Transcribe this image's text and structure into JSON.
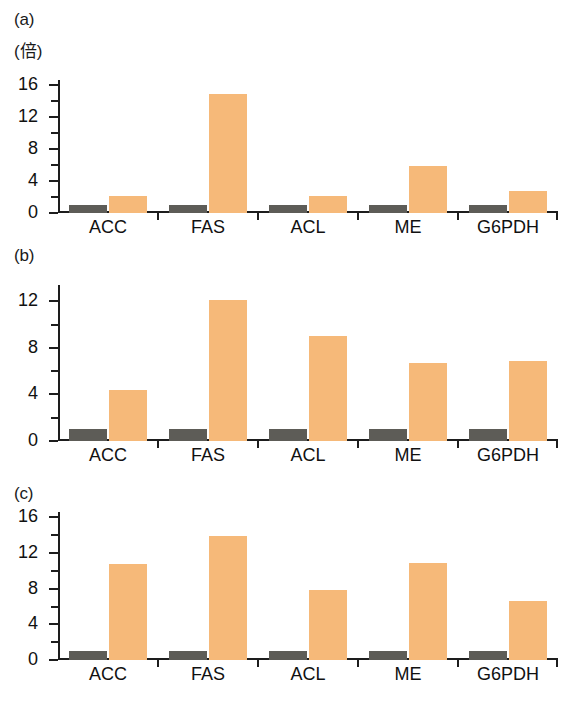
{
  "figure": {
    "unit_label": "(倍)",
    "categories": [
      "ACC",
      "FAS",
      "ACL",
      "ME",
      "G6PDH"
    ],
    "series_names": [
      "control",
      "treatment"
    ],
    "colors": {
      "control": "#5d5c57",
      "treatment": "#f6b979",
      "axis": "#1d1d1d",
      "background": "#ffffff"
    }
  },
  "panels": [
    {
      "label": "(a)",
      "unit_label": "(倍)",
      "ylim": [
        0,
        16.6
      ],
      "yticks_major": [
        0,
        4,
        8,
        12,
        16
      ],
      "yticks_minor": [
        2,
        6,
        10,
        14
      ],
      "ytick_labels": [
        "0",
        "4",
        "8",
        "12",
        "16"
      ]
    },
    {
      "label": "(b)",
      "ylim": [
        0,
        13.4
      ],
      "yticks_major": [
        0,
        4,
        8,
        12
      ],
      "yticks_minor": [
        2,
        6,
        10
      ],
      "ytick_labels": [
        "0",
        "4",
        "8",
        "12"
      ]
    },
    {
      "label": "(c)",
      "ylim": [
        0,
        16.6
      ],
      "yticks_major": [
        0,
        4,
        8,
        12,
        16
      ],
      "yticks_minor": [
        2,
        6,
        10,
        14
      ],
      "ytick_labels": [
        "0",
        "4",
        "8",
        "12",
        "16"
      ]
    }
  ],
  "chart_data": [
    {
      "type": "bar",
      "title": "(a)",
      "xlabel": "",
      "ylabel": "(倍)",
      "ylim": [
        0,
        16.6
      ],
      "yticks": [
        0,
        4,
        8,
        12,
        16
      ],
      "grid": false,
      "legend": "none",
      "categories": [
        "ACC",
        "FAS",
        "ACL",
        "ME",
        "G6PDH"
      ],
      "series": [
        {
          "name": "control",
          "color": "#5d5c57",
          "values": [
            1.0,
            1.0,
            1.0,
            1.0,
            1.0
          ]
        },
        {
          "name": "treatment",
          "color": "#f6b979",
          "values": [
            2.1,
            14.8,
            2.1,
            5.9,
            2.8
          ]
        }
      ]
    },
    {
      "type": "bar",
      "title": "(b)",
      "xlabel": "",
      "ylabel": "",
      "ylim": [
        0,
        13.4
      ],
      "yticks": [
        0,
        4,
        8,
        12
      ],
      "grid": false,
      "legend": "none",
      "categories": [
        "ACC",
        "FAS",
        "ACL",
        "ME",
        "G6PDH"
      ],
      "series": [
        {
          "name": "control",
          "color": "#5d5c57",
          "values": [
            1.0,
            1.0,
            1.0,
            1.0,
            1.0
          ]
        },
        {
          "name": "treatment",
          "color": "#f6b979",
          "values": [
            4.4,
            12.1,
            9.0,
            6.7,
            6.9
          ]
        }
      ]
    },
    {
      "type": "bar",
      "title": "(c)",
      "xlabel": "",
      "ylabel": "",
      "ylim": [
        0,
        16.6
      ],
      "yticks": [
        0,
        4,
        8,
        12,
        16
      ],
      "grid": false,
      "legend": "none",
      "categories": [
        "ACC",
        "FAS",
        "ACL",
        "ME",
        "G6PDH"
      ],
      "series": [
        {
          "name": "control",
          "color": "#5d5c57",
          "values": [
            1.0,
            1.0,
            1.0,
            1.0,
            1.0
          ]
        },
        {
          "name": "treatment",
          "color": "#f6b979",
          "values": [
            10.8,
            13.9,
            7.9,
            10.9,
            6.6
          ]
        }
      ]
    }
  ]
}
